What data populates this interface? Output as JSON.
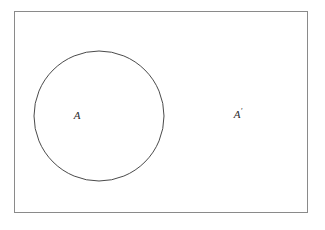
{
  "figure": {
    "type": "venn-diagram",
    "background_color": "#ffffff"
  },
  "universal_set": {
    "name": "universal-set-rectangle",
    "shape": "rectangle",
    "x": 14,
    "y": 11,
    "width": 294,
    "height": 202,
    "stroke_color": "#8a8a8a",
    "stroke_width": 1,
    "fill": "none"
  },
  "set_a": {
    "name": "set-a-circle",
    "shape": "circle",
    "cx": 99,
    "cy": 116,
    "r": 65,
    "stroke_color": "#4a4a4a",
    "stroke_width": 1,
    "fill": "none"
  },
  "labels": {
    "set_a": {
      "text": "A",
      "prime": "",
      "x": 77,
      "y": 116,
      "color": "#2b2b2b"
    },
    "set_a_complement": {
      "text": "A",
      "prime": "′",
      "x": 238,
      "y": 115,
      "color": "#2b2b2b"
    }
  }
}
